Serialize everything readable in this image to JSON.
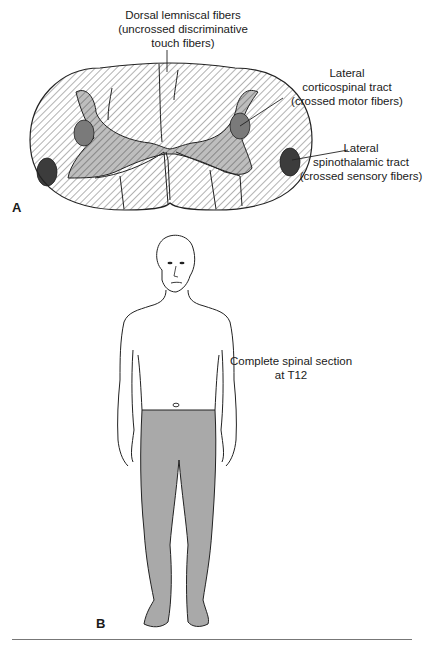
{
  "panel_a": {
    "letter": "A",
    "title": "Spinal cord cross-section",
    "labels": {
      "dorsal": [
        "Dorsal lemniscal fibers",
        "(uncrossed discriminative",
        "touch fibers)"
      ],
      "corticospinal": [
        "Lateral",
        "corticospinal tract",
        "(crossed motor fibers)"
      ],
      "spinothalamic": [
        "Lateral",
        "spinothalamic tract",
        "(crossed sensory fibers)"
      ]
    },
    "colors": {
      "white_matter_hatch": "#555555",
      "gray_matter": "#b3b3b3",
      "corticospinal_tract": "#7a7a7a",
      "spinothalamic_tract": "#3c3c3c",
      "outline": "#222222"
    }
  },
  "panel_b": {
    "letter": "B",
    "title": "Human figure with lesion level",
    "labels": {
      "lesion": [
        "Complete spinal section",
        "at T12"
      ]
    },
    "colors": {
      "affected_region": "#a9a9a9",
      "outline": "#222222"
    }
  }
}
